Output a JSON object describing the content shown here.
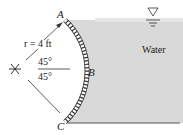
{
  "diagram": {
    "points": {
      "A": "A",
      "B": "B",
      "C": "C"
    },
    "radius_label": "r = 4 ft",
    "angle_top": "45°",
    "angle_bottom": "45°",
    "fluid_label": "Water",
    "colors": {
      "water": "#d9d9d9",
      "line": "#333333"
    }
  }
}
